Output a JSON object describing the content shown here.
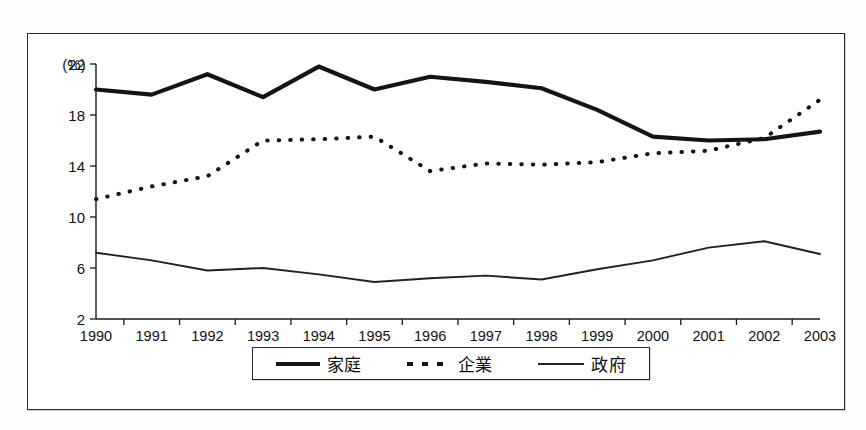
{
  "chart_data": {
    "type": "line",
    "title": "",
    "subtitle": "",
    "xlabel": "",
    "ylabel": "",
    "unit_label": "(%)",
    "categories": [
      "1990",
      "1991",
      "1992",
      "1993",
      "1994",
      "1995",
      "1996",
      "1997",
      "1998",
      "1999",
      "2000",
      "2001",
      "2002",
      "2003"
    ],
    "x": [
      1990,
      1991,
      1992,
      1993,
      1994,
      1995,
      1996,
      1997,
      1998,
      1999,
      2000,
      2001,
      2002,
      2003
    ],
    "ylim": [
      2,
      22
    ],
    "yticks": [
      2,
      6,
      10,
      14,
      18,
      22
    ],
    "ytick_labels": [
      "2",
      "6",
      "10",
      "14",
      "18",
      "22"
    ],
    "grid": false,
    "legend_position": "bottom",
    "series": [
      {
        "name": "家庭",
        "style": "solid-thick",
        "values": [
          20.0,
          19.6,
          21.2,
          19.4,
          21.8,
          20.0,
          21.0,
          20.6,
          20.1,
          18.4,
          16.3,
          16.0,
          16.1,
          16.7
        ]
      },
      {
        "name": "企業",
        "style": "dotted",
        "values": [
          11.4,
          12.4,
          13.2,
          16.0,
          16.1,
          16.3,
          13.6,
          14.2,
          14.1,
          14.3,
          15.0,
          15.2,
          16.2,
          19.2
        ]
      },
      {
        "name": "政府",
        "style": "solid-thin",
        "values": [
          7.2,
          6.6,
          5.8,
          6.0,
          5.5,
          4.9,
          5.2,
          5.4,
          5.1,
          5.9,
          6.6,
          7.6,
          8.1,
          7.1
        ]
      }
    ]
  },
  "legend": {
    "items": [
      {
        "label": "家庭",
        "marker": "solid-thick-line-icon"
      },
      {
        "label": "企業",
        "marker": "dotted-line-icon"
      },
      {
        "label": "政府",
        "marker": "solid-thin-line-icon"
      }
    ]
  }
}
